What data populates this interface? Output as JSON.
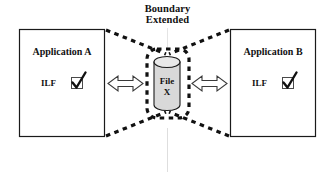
{
  "diagram": {
    "boundary_note": {
      "line1": "Boundary",
      "line2": "Extended"
    },
    "applications": [
      {
        "id": "app-a",
        "title": "Application A",
        "data_label": "ILF",
        "checkbox_checked": true,
        "checkbox_glyph": "check-mark"
      },
      {
        "id": "app-b",
        "title": "Application B",
        "data_label": "ILF",
        "checkbox_checked": true,
        "checkbox_glyph": "check-mark"
      }
    ],
    "shared_store": {
      "id": "file-x",
      "shape": "cylinder-database",
      "line1": "File",
      "line2": "X"
    },
    "connectors": [
      {
        "id": "left-connector",
        "style": "double-headed-outline-arrow"
      },
      {
        "id": "right-connector",
        "style": "double-headed-outline-arrow"
      }
    ],
    "colors": {
      "stroke": "#1a1a1a",
      "cylinder_fill": "#d9d9d9",
      "cylinder_top_fill": "#e8e8e8",
      "arrow_fill": "#ffffff",
      "background": "#ffffff",
      "faint_guide": "#dddddd"
    }
  }
}
